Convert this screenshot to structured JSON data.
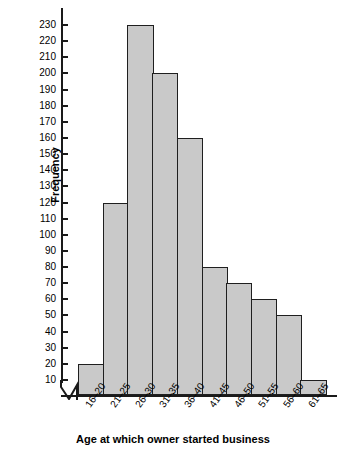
{
  "chart_data": {
    "type": "bar",
    "title": "",
    "xlabel": "Age at which owner started business",
    "ylabel": "Frequency",
    "categories": [
      "16–20",
      "21–25",
      "26–30",
      "31–35",
      "36–40",
      "41–45",
      "46–50",
      "51–55",
      "56–60",
      "61–65"
    ],
    "values": [
      20,
      120,
      230,
      200,
      160,
      80,
      70,
      60,
      50,
      10
    ],
    "yticks": [
      10,
      20,
      30,
      40,
      50,
      60,
      70,
      80,
      90,
      100,
      110,
      120,
      130,
      140,
      150,
      160,
      170,
      180,
      190,
      200,
      210,
      220,
      230
    ],
    "ytick_labels": [
      "10",
      "20",
      "30",
      "40",
      "50",
      "60",
      "70",
      "80",
      "90",
      "100",
      "110",
      "120",
      "130",
      "140",
      "150",
      "160",
      "170",
      "180",
      "190",
      "200",
      "210",
      "220",
      "230"
    ],
    "ylim": [
      0,
      236
    ],
    "grid": false,
    "legend": null,
    "axis_break": "y-axis break between 0 and 10",
    "bar_fill_color": "#c9c9c9",
    "bar_edge_color": "#1f1f1f",
    "axis_color": "#1a1a1a",
    "background_color": "#ffffff"
  },
  "axes": {
    "y_title": "Frequency",
    "x_title": "Age at which owner started business"
  }
}
